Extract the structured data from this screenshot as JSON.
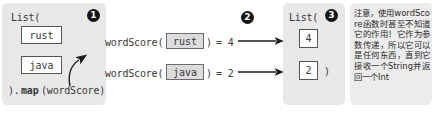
{
  "input_panel": {
    "header": "List(",
    "footer_close": ").",
    "footer_method": "map",
    "footer_arg": "(wordScore)",
    "items": [
      "rust",
      "java"
    ],
    "badge": "1"
  },
  "equations": [
    {
      "fn_name": "wordScore(",
      "arg": "rust",
      "close": ")",
      "equals": "= 4"
    },
    {
      "fn_name": "wordScore(",
      "arg": "java",
      "close": ")",
      "equals": "= 2"
    }
  ],
  "arrow_badge": "2",
  "output_panel": {
    "header": "List(",
    "items": [
      "4",
      "2"
    ],
    "close_paren": ")",
    "badge": "3"
  },
  "note": {
    "text": "注意，使用wordScore函数时甚至不知道它的作用！它作为参数传递，所以它可以是任何东西，直到它接收一个String并返回一个Int"
  },
  "colors": {
    "panel_bg": "#e8e8e8",
    "note_bg": "#ececec",
    "box_border": "#555555",
    "box_shaded": "#dcdcdc",
    "badge_bg": "#141414",
    "text": "#3a3a3a"
  }
}
